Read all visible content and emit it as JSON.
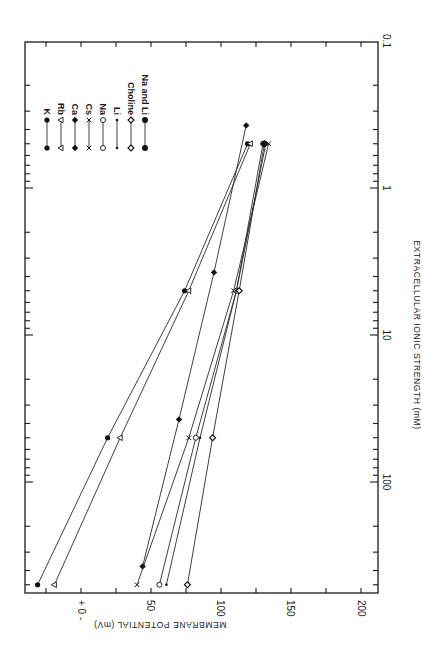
{
  "chart_data": {
    "type": "line",
    "orientation": "rotated-90-clockwise",
    "title": "",
    "xlabel": "EXTRACELLULAR IONIC STRENGTH (mM)",
    "ylabel": "MEMBRANE POTENTIAL (mV)",
    "x_scale": "log",
    "xlim": [
      0.1,
      570
    ],
    "x_tick_labels": [
      "0.1",
      "1",
      "10",
      "100"
    ],
    "ylim": [
      -25,
      200
    ],
    "y_tick_labels": [
      "+ 0 -",
      "50",
      "100",
      "150",
      "200"
    ],
    "y_note": "Positive axis values denote hyperpolarization (inside negative); left of 0 is the '+' side",
    "grid": false,
    "legend_position": "upper-left of plot (rotated)",
    "series": [
      {
        "name": "K",
        "marker": "filled-circle",
        "x": [
          0.5,
          5,
          50,
          500
        ],
        "values": [
          119,
          74,
          19,
          -31
        ]
      },
      {
        "name": "Rb",
        "marker": "open-triangle",
        "x": [
          0.5,
          5,
          50,
          500
        ],
        "values": [
          121,
          77,
          28,
          -19
        ]
      },
      {
        "name": "Ca",
        "marker": "filled-diamond",
        "x": [
          0.375,
          3.75,
          37.5,
          375
        ],
        "values": [
          118,
          95,
          70,
          44
        ]
      },
      {
        "name": "Cs",
        "marker": "cross",
        "x": [
          0.5,
          5,
          50,
          500
        ],
        "values": [
          134,
          109,
          77,
          40
        ]
      },
      {
        "name": "Na",
        "marker": "open-circle",
        "x": [
          0.5,
          5,
          50,
          500
        ],
        "values": [
          130,
          111,
          82,
          56
        ]
      },
      {
        "name": "Li",
        "marker": "small-dot",
        "x": [
          0.5,
          5,
          50,
          500
        ],
        "values": [
          132,
          111,
          85,
          61
        ]
      },
      {
        "name": "Choline",
        "marker": "open-diamond",
        "x": [
          0.5,
          5,
          50,
          500
        ],
        "values": [
          131,
          113,
          94,
          76
        ]
      },
      {
        "name": "Na and Li",
        "marker": "filled-circle-large",
        "x": [
          0.5
        ],
        "values": [
          131
        ]
      }
    ]
  },
  "legend": {
    "items": [
      {
        "label": "K"
      },
      {
        "label": "Rb"
      },
      {
        "label": "Ca"
      },
      {
        "label": "Cs"
      },
      {
        "label": "Na"
      },
      {
        "label": "Li"
      },
      {
        "label": "Choline"
      },
      {
        "label": "Na and Li"
      }
    ]
  },
  "axes": {
    "x_title": "EXTRACELLULAR IONIC STRENGTH (mM)",
    "y_title": "MEMBRANE POTENTIAL (mV)",
    "x_ticks": [
      {
        "label": "0.1"
      },
      {
        "label": "1"
      },
      {
        "label": "10"
      },
      {
        "label": "100"
      }
    ],
    "y_ticks": [
      {
        "label": "+ 0 -"
      },
      {
        "label": "50"
      },
      {
        "label": "100"
      },
      {
        "label": "150"
      },
      {
        "label": "200"
      }
    ]
  }
}
